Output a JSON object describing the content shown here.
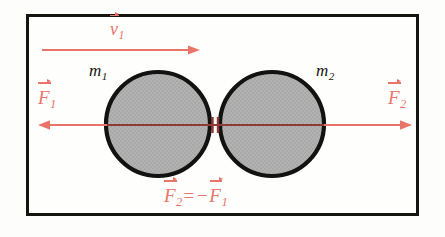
{
  "figure": {
    "background_color": "#fdfdfb",
    "frame_color": "#15140f",
    "width": 445,
    "height": 237
  },
  "colors": {
    "vector_red": "#e8756a",
    "vector_red_dark": "#8e3b37",
    "sphere_fill": "#b0b0b0",
    "sphere_stroke": "#121210",
    "label_black": "#16150f"
  },
  "labels": {
    "velocity": {
      "symbol": "v",
      "subscript": "1",
      "text": "v⃗1"
    },
    "force_left": {
      "symbol": "F",
      "subscript": "1",
      "text": "F⃗1"
    },
    "force_right": {
      "symbol": "F",
      "subscript": "2",
      "text": "F⃗2"
    },
    "mass_left": {
      "symbol": "m",
      "subscript": "1",
      "text": "m1"
    },
    "mass_right": {
      "symbol": "m",
      "subscript": "2",
      "text": "m2"
    },
    "equation": {
      "lhs_symbol": "F",
      "lhs_subscript": "2",
      "operator_equals": "=",
      "operator_minus": "−",
      "rhs_symbol": "F",
      "rhs_subscript": "1",
      "text": "F⃗2 = − F⃗1"
    }
  },
  "shapes": {
    "sphere_left": {
      "name": "m1",
      "cx": 158,
      "cy": 124,
      "r": 52
    },
    "sphere_right": {
      "name": "m2",
      "cx": 272,
      "cy": 124,
      "r": 52
    },
    "contact_point": {
      "x": 215,
      "y": 124
    }
  },
  "arrows": {
    "velocity": {
      "name": "v1",
      "x1": 42,
      "y1": 50,
      "x2": 200,
      "y2": 50,
      "direction": "right"
    },
    "force_left": {
      "name": "F1",
      "x1": 215,
      "y1": 125,
      "x2": 38,
      "y2": 125,
      "direction": "left"
    },
    "force_right": {
      "name": "F2",
      "x1": 215,
      "y1": 125,
      "x2": 412,
      "y2": 125,
      "direction": "right"
    }
  }
}
